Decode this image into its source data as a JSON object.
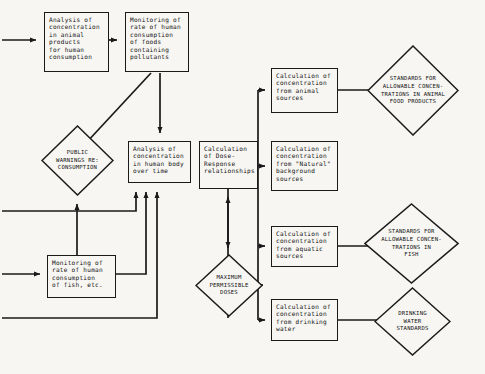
{
  "diagram": {
    "type": "flowchart",
    "canvas": {
      "width": 485,
      "height": 374
    },
    "colors": {
      "stroke": "#1a1a1a",
      "fill": "#f7f6f3",
      "text": "#111111",
      "background": "#f7f6f3"
    },
    "nodes": [
      {
        "id": "animal-products",
        "shape": "rectangle",
        "text": "Analysis of\nconcentration\nin animal\nproducts\nfor human\nconsumption",
        "x": 44,
        "y": 12,
        "w": 65,
        "h": 60
      },
      {
        "id": "monitoring-foods",
        "shape": "rectangle",
        "text": "Monitoring of\nrate of human\nconsumption\nof foods\ncontaining\npollutants",
        "x": 125,
        "y": 12,
        "w": 64,
        "h": 60
      },
      {
        "id": "public-warnings",
        "shape": "diamond",
        "text": "PUBLIC\nWARNINGS RE:\nCONSUMPTION",
        "x": 41,
        "y": 125,
        "w": 73,
        "h": 71
      },
      {
        "id": "human-body",
        "shape": "rectangle",
        "text": "Analysis of\nconcentration\nin human body\nover time",
        "x": 128,
        "y": 141,
        "w": 63,
        "h": 42
      },
      {
        "id": "dose-response",
        "shape": "rectangle",
        "text": "Calculation\nof Dose-\nResponse\nrelationships",
        "x": 199,
        "y": 141,
        "w": 59,
        "h": 48
      },
      {
        "id": "monitoring-fish",
        "shape": "rectangle",
        "text": "Monitoring of\nrate of human\nconsumption\nof fish, etc.",
        "x": 47,
        "y": 255,
        "w": 69,
        "h": 43
      },
      {
        "id": "max-doses",
        "shape": "diamond",
        "text": "MAXIMUM\nPERMISSIBLE\nDOSES",
        "x": 195,
        "y": 254,
        "w": 68,
        "h": 63
      },
      {
        "id": "calc-animal",
        "shape": "rectangle",
        "text": "Calculation of\nconcentration\nfrom animal\nsources",
        "x": 271,
        "y": 68,
        "w": 67,
        "h": 45
      },
      {
        "id": "calc-natural",
        "shape": "rectangle",
        "text": "Calculation of\nconcentration\nfrom \"Natural\"\nbackground\nsources",
        "x": 271,
        "y": 141,
        "w": 67,
        "h": 50
      },
      {
        "id": "calc-aquatic",
        "shape": "rectangle",
        "text": "Calculation of\nconcentration\nfrom aquatic\nsources",
        "x": 271,
        "y": 226,
        "w": 67,
        "h": 41
      },
      {
        "id": "calc-drinking",
        "shape": "rectangle",
        "text": "Calculation of\nconcentration\nfrom drinking\nwater",
        "x": 271,
        "y": 299,
        "w": 67,
        "h": 42
      },
      {
        "id": "std-animal-food",
        "shape": "diamond",
        "text": "STANDARDS FOR\nALLOWABLE CONCEN-\nTRATIONS IN ANIMAL\nFOOD PRODUCTS",
        "x": 367,
        "y": 45,
        "w": 92,
        "h": 91
      },
      {
        "id": "std-fish",
        "shape": "diamond",
        "text": "STANDARDS FOR\nALLOWABLE CONCEN-\nTRATIONS IN\nFISH",
        "x": 364,
        "y": 203,
        "w": 95,
        "h": 81
      },
      {
        "id": "std-drinking-water",
        "shape": "diamond",
        "text": "DRINKING\nWATER\nSTANDARDS",
        "x": 374,
        "y": 287,
        "w": 77,
        "h": 69
      }
    ],
    "edges": [
      {
        "id": "in-to-animal-products",
        "from": "external-left",
        "to": "animal-products"
      },
      {
        "id": "animal-products-to-monitoring-foods",
        "from": "animal-products",
        "to": "monitoring-foods"
      },
      {
        "id": "monitoring-foods-to-public-warnings",
        "from": "monitoring-foods",
        "to": "public-warnings"
      },
      {
        "id": "monitoring-foods-to-human-body",
        "from": "monitoring-foods",
        "to": "human-body"
      },
      {
        "id": "external-left-to-public-warnings",
        "from": "external-left",
        "to": "public-warnings"
      },
      {
        "id": "monitoring-fish-to-public-warnings",
        "from": "monitoring-fish",
        "to": "public-warnings"
      },
      {
        "id": "in-to-monitoring-fish",
        "from": "external-left",
        "to": "monitoring-fish"
      },
      {
        "id": "monitoring-fish-to-human-body",
        "from": "monitoring-fish",
        "to": "human-body"
      },
      {
        "id": "bottom-loop-to-human-body",
        "from": "external-left-bottom",
        "to": "human-body"
      },
      {
        "id": "human-body-to-dose-response",
        "from": "human-body",
        "to": "dose-response"
      },
      {
        "id": "dose-response-to-max-doses",
        "from": "dose-response",
        "to": "max-doses"
      },
      {
        "id": "max-doses-to-calc-animal",
        "from": "max-doses",
        "to": "calc-animal"
      },
      {
        "id": "max-doses-to-calc-natural",
        "from": "max-doses",
        "to": "calc-natural"
      },
      {
        "id": "max-doses-to-calc-aquatic",
        "from": "max-doses",
        "to": "calc-aquatic"
      },
      {
        "id": "max-doses-to-calc-drinking",
        "from": "max-doses",
        "to": "calc-drinking"
      },
      {
        "id": "calc-animal-to-std-animal-food",
        "from": "calc-animal",
        "to": "std-animal-food"
      },
      {
        "id": "calc-aquatic-to-std-fish",
        "from": "calc-aquatic",
        "to": "std-fish"
      },
      {
        "id": "calc-drinking-to-std-drinking-water",
        "from": "calc-drinking",
        "to": "std-drinking-water"
      }
    ]
  }
}
